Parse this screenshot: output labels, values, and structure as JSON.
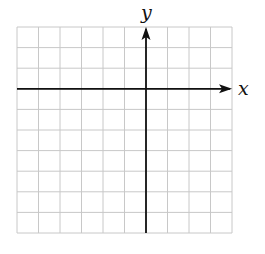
{
  "figure": {
    "type": "coordinate-plane",
    "x_axis_label": "x",
    "y_axis_label": "y",
    "grid": {
      "columns": 10,
      "rows": 10,
      "left": 17,
      "top": 27,
      "right": 232,
      "bottom": 233,
      "origin_column_index": 6,
      "origin_row_index": 3
    },
    "colors": {
      "grid_line": "#c8c8c8",
      "axis": "#111111",
      "background": "#ffffff"
    }
  }
}
